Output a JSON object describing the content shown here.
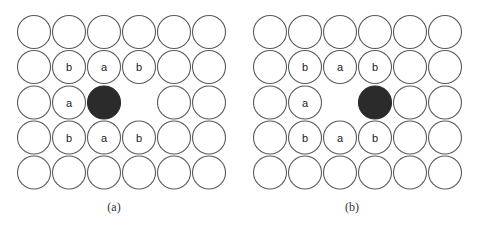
{
  "figure": {
    "grid": {
      "cols": 6,
      "rows": 5,
      "pitch": 35,
      "radius": 16.5
    },
    "colors": {
      "stroke": "#5a5a5a",
      "dark_fill": "#2b2b2b",
      "background": "#ffffff"
    },
    "panels": [
      {
        "id": "a",
        "caption": "(a)",
        "origin_x": 34,
        "origin_y": 32,
        "caption_x": 114,
        "caption_y": 207,
        "vacancy": [
          3,
          2
        ],
        "dark_atom": [
          2,
          2
        ],
        "labels": [
          {
            "col": 1,
            "row": 1,
            "text": "b"
          },
          {
            "col": 2,
            "row": 1,
            "text": "a"
          },
          {
            "col": 3,
            "row": 1,
            "text": "b"
          },
          {
            "col": 1,
            "row": 2,
            "text": "a"
          },
          {
            "col": 1,
            "row": 3,
            "text": "b"
          },
          {
            "col": 2,
            "row": 3,
            "text": "a"
          },
          {
            "col": 3,
            "row": 3,
            "text": "b"
          }
        ]
      },
      {
        "id": "b",
        "caption": "(b)",
        "origin_x": 270,
        "origin_y": 32,
        "caption_x": 352,
        "caption_y": 207,
        "vacancy": [
          2,
          2
        ],
        "dark_atom": [
          3,
          2
        ],
        "labels": [
          {
            "col": 1,
            "row": 1,
            "text": "b"
          },
          {
            "col": 2,
            "row": 1,
            "text": "a"
          },
          {
            "col": 3,
            "row": 1,
            "text": "b"
          },
          {
            "col": 1,
            "row": 2,
            "text": "a"
          },
          {
            "col": 1,
            "row": 3,
            "text": "b"
          },
          {
            "col": 2,
            "row": 3,
            "text": "a"
          },
          {
            "col": 3,
            "row": 3,
            "text": "b"
          }
        ]
      }
    ]
  }
}
